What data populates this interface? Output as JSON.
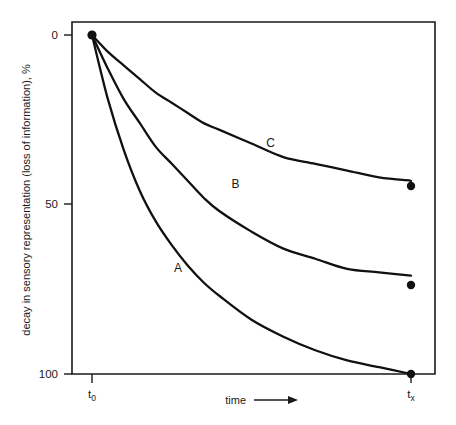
{
  "chart_data": {
    "type": "line",
    "title": "",
    "subtitle": "",
    "xlabel": "time",
    "ylabel": "decay in sensory representation (loss of information), %",
    "x_axis": {
      "tick_labels": [
        "t",
        "t"
      ],
      "tick_subscripts": [
        "0",
        "x"
      ],
      "tick_values": [
        0,
        1
      ],
      "arrow_label": "time",
      "arrow_glyph": "⟶",
      "direction": "increasing-right"
    },
    "y_axis": {
      "tick_labels": [
        "0",
        "50",
        "100"
      ],
      "tick_values": [
        0,
        50,
        100
      ],
      "ylim": [
        0,
        100
      ],
      "inverted": true,
      "units": "%"
    },
    "grid": false,
    "legend_position": "inline-curve-labels",
    "series": [
      {
        "name": "A",
        "label": "A",
        "label_x": 0.27,
        "label_y": 70,
        "decay_rate": 3.2,
        "end_value": 100,
        "x": [
          0,
          0.05,
          0.1,
          0.15,
          0.2,
          0.25,
          0.3,
          0.35,
          0.4,
          0.5,
          0.6,
          0.7,
          0.8,
          0.9,
          1.0
        ],
        "values": [
          0,
          19,
          34,
          46,
          55,
          62,
          68,
          73,
          77,
          84,
          89,
          93,
          96,
          98,
          100
        ]
      },
      {
        "name": "B",
        "label": "B",
        "label_x": 0.45,
        "label_y": 45,
        "decay_rate": 1.7,
        "end_value": 71,
        "x": [
          0,
          0.05,
          0.1,
          0.15,
          0.2,
          0.25,
          0.3,
          0.35,
          0.4,
          0.5,
          0.6,
          0.7,
          0.8,
          0.9,
          1.0
        ],
        "values": [
          0,
          10,
          19,
          26,
          33,
          38,
          43,
          48,
          52,
          58,
          63,
          66,
          69,
          70,
          71
        ]
      },
      {
        "name": "C",
        "label": "C",
        "label_x": 0.56,
        "label_y": 33,
        "decay_rate": 1.1,
        "end_value": 43,
        "x": [
          0,
          0.05,
          0.1,
          0.15,
          0.2,
          0.25,
          0.3,
          0.35,
          0.4,
          0.5,
          0.6,
          0.7,
          0.8,
          0.9,
          1.0
        ],
        "values": [
          0,
          5,
          9,
          13,
          17,
          20,
          23,
          26,
          28,
          32,
          36,
          38,
          40,
          42,
          43
        ]
      }
    ],
    "markers": [
      {
        "series": "origin",
        "x": 0,
        "y": 0
      },
      {
        "series": "C",
        "x": 1,
        "y": 43
      },
      {
        "series": "B",
        "x": 1,
        "y": 71
      },
      {
        "series": "A",
        "x": 1,
        "y": 100
      }
    ],
    "colors": {
      "curve": "#111111",
      "axis": "#1a1a1a",
      "background": "#ffffff",
      "marker": "#111111"
    }
  }
}
